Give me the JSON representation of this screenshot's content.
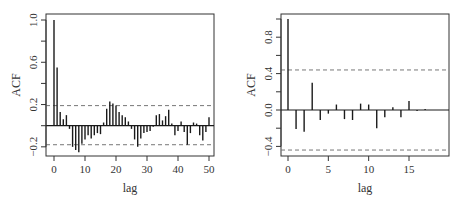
{
  "chart_data": [
    {
      "type": "bar",
      "subtype": "acf-stem",
      "title": "",
      "xlabel": "lag",
      "ylabel": "ACF",
      "xlim": [
        -2,
        52
      ],
      "ylim": [
        -0.29,
        1.06
      ],
      "xticks": [
        0,
        10,
        20,
        30,
        40,
        50
      ],
      "xtick_labels": [
        "0",
        "10",
        "20",
        "30",
        "40",
        "50"
      ],
      "yticks": [
        -0.2,
        0.0,
        0.2,
        0.4,
        0.6,
        0.8,
        1.0
      ],
      "ytick_labels": [
        "-0.2",
        "",
        "0.2",
        "",
        "0.6",
        "",
        "1.0"
      ],
      "confidence_band": [
        -0.18,
        0.19
      ],
      "grid": false,
      "lags": [
        0,
        1,
        2,
        3,
        4,
        5,
        6,
        7,
        8,
        9,
        10,
        11,
        12,
        13,
        14,
        15,
        16,
        17,
        18,
        19,
        20,
        21,
        22,
        23,
        24,
        25,
        26,
        27,
        28,
        29,
        30,
        31,
        32,
        33,
        34,
        35,
        36,
        37,
        38,
        39,
        40,
        41,
        42,
        43,
        44,
        45,
        46,
        47,
        48,
        49,
        50
      ],
      "values": [
        1.0,
        0.55,
        0.13,
        0.06,
        0.1,
        -0.03,
        -0.2,
        -0.23,
        -0.25,
        -0.17,
        -0.13,
        -0.09,
        -0.12,
        -0.09,
        -0.07,
        -0.08,
        0.03,
        0.16,
        0.23,
        0.21,
        0.19,
        0.13,
        0.1,
        0.08,
        0.04,
        -0.03,
        -0.13,
        -0.2,
        -0.12,
        -0.07,
        -0.06,
        -0.05,
        -0.01,
        0.1,
        0.11,
        0.05,
        0.09,
        0.15,
        0.02,
        -0.09,
        -0.05,
        0.04,
        -0.06,
        -0.18,
        -0.07,
        0.03,
        0.02,
        -0.09,
        -0.14,
        -0.06,
        0.08
      ]
    },
    {
      "type": "bar",
      "subtype": "acf-stem",
      "title": "",
      "xlabel": "lag",
      "ylabel": "ACF",
      "xlim": [
        -1,
        19.8
      ],
      "ylim": [
        -0.48,
        1.05
      ],
      "xticks": [
        0,
        5,
        10,
        15
      ],
      "xtick_labels": [
        "0",
        "5",
        "10",
        "15"
      ],
      "yticks": [
        -0.4,
        -0.2,
        0.0,
        0.2,
        0.4,
        0.6,
        0.8,
        1.0
      ],
      "ytick_labels": [
        "-0.4",
        "",
        "0.0",
        "",
        "0.4",
        "",
        "0.8",
        ""
      ],
      "confidence_band": [
        -0.44,
        0.44
      ],
      "grid": false,
      "lags": [
        0,
        1,
        2,
        3,
        4,
        5,
        6,
        7,
        8,
        9,
        10,
        11,
        12,
        13,
        14,
        15,
        16,
        17,
        18,
        19
      ],
      "values": [
        1.0,
        -0.21,
        -0.24,
        0.3,
        -0.11,
        -0.04,
        0.06,
        -0.1,
        -0.11,
        0.07,
        0.06,
        -0.2,
        -0.08,
        0.03,
        -0.08,
        0.1,
        -0.01,
        0.01,
        0.0,
        0.0
      ]
    }
  ],
  "colors": {
    "bar": "#1a1a1a",
    "axis": "#333333",
    "band": "#777777",
    "background": "#ffffff"
  }
}
